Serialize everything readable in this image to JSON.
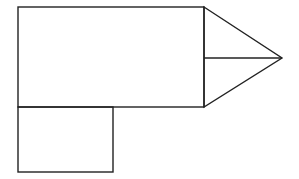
{
  "diagram": {
    "stroke_color": "#222222",
    "background": "#ffffff",
    "shapes": {
      "large_rectangle": {
        "x": 18,
        "y": 7,
        "width": 186,
        "height": 100
      },
      "triangle": {
        "points": [
          [
            204,
            7
          ],
          [
            282,
            58
          ],
          [
            204,
            107
          ]
        ]
      },
      "triangle_midline": {
        "x1": 204,
        "y1": 58,
        "x2": 282,
        "y2": 58
      },
      "small_square": {
        "x": 18,
        "y": 107,
        "width": 95,
        "height": 65
      }
    }
  }
}
